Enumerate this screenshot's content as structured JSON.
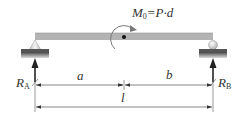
{
  "diagram": {
    "type": "simply-supported-beam",
    "moment_label": {
      "symbol": "M",
      "sub": "0",
      "rest": "=P·d"
    },
    "reaction_left": {
      "symbol": "R",
      "sub": "A"
    },
    "reaction_right": {
      "symbol": "R",
      "sub": "B"
    },
    "dim_a": "a",
    "dim_b": "b",
    "dim_l": "l",
    "colors": {
      "beam": "#b3b3b3",
      "ground": "#555555",
      "line": "#333333",
      "arrow": "#222222"
    }
  }
}
